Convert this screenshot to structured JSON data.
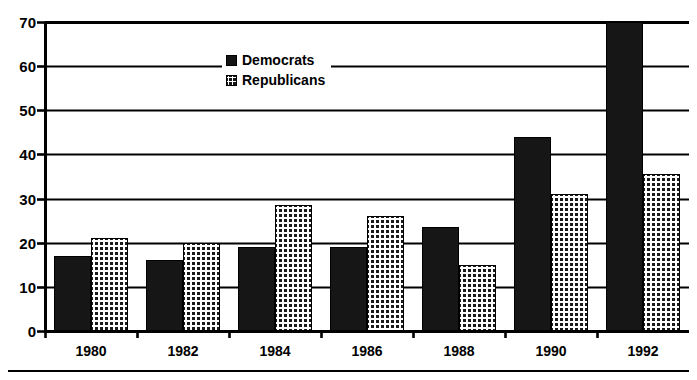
{
  "chart_data": {
    "type": "bar",
    "title": "",
    "subtitle": "",
    "xlabel": "",
    "ylabel": "",
    "categories": [
      "1980",
      "1982",
      "1984",
      "1986",
      "1988",
      "1990",
      "1992"
    ],
    "series": [
      {
        "name": "Democrats",
        "values": [
          17,
          16,
          19,
          19,
          23.5,
          44,
          70
        ]
      },
      {
        "name": "Republicans",
        "values": [
          21,
          20,
          28.5,
          26,
          15,
          31,
          35.5
        ]
      }
    ],
    "ylim": [
      0,
      70
    ],
    "yticks": [
      0,
      10,
      20,
      30,
      40,
      50,
      60,
      70
    ],
    "ytick_labels": [
      "0",
      "10",
      "20",
      "30",
      "40",
      "50",
      "60",
      "70"
    ],
    "grid": "horizontal",
    "legend_position": "top-center",
    "annotations": [],
    "colors": {
      "democrats": "#161616",
      "republicans_fill": "#1a1a1a",
      "republicans_pattern": "#ffffff",
      "axis": "#000000",
      "grid": "#000000",
      "background": "#ffffff"
    },
    "note_1992_democrats_clipped_at_axis_max": true
  },
  "legend": {
    "items": [
      {
        "label": "Democrats",
        "swatch": "solid-black-square"
      },
      {
        "label": "Republicans",
        "swatch": "checkered-square"
      }
    ]
  },
  "icons": {
    "legend_democrat_swatch": "solid-square-icon",
    "legend_republican_swatch": "checkered-square-icon"
  }
}
